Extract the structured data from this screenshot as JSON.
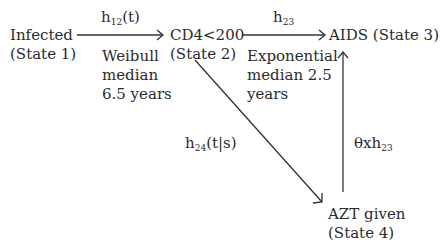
{
  "diagram": {
    "type": "multi-state transition model",
    "states": [
      {
        "id": 1,
        "name": "Infected",
        "label": "(State 1)"
      },
      {
        "id": 2,
        "name": "CD4<200",
        "label": "(State 2)"
      },
      {
        "id": 3,
        "name": "AIDS (State 3)"
      },
      {
        "id": 4,
        "name": "AZT given",
        "label": "(State 4)"
      }
    ],
    "transitions": [
      {
        "from": 1,
        "to": 2,
        "hazard_base": "h",
        "hazard_sub": "12",
        "hazard_arg": "(t)",
        "note": [
          "Weibull",
          "median",
          "6.5 years"
        ]
      },
      {
        "from": 2,
        "to": 3,
        "hazard_base": "h",
        "hazard_sub": "23",
        "hazard_arg": "",
        "note": [
          "Exponential",
          "median 2.5",
          "years"
        ]
      },
      {
        "from": 2,
        "to": 4,
        "hazard_base": "h",
        "hazard_sub": "24",
        "hazard_arg": "(t|s)"
      },
      {
        "from": 4,
        "to": 3,
        "hazard_prefix": "θxh",
        "hazard_sub": "23"
      }
    ]
  }
}
